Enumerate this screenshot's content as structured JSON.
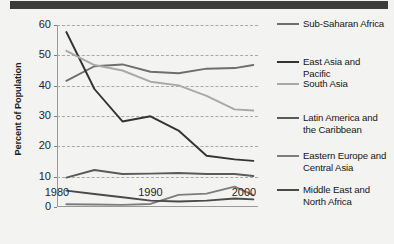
{
  "top_band": {
    "color": "#3b3b3b"
  },
  "axes": {
    "ylabel": "Percent of Population",
    "yticks": [
      "60",
      "50",
      "40",
      "30",
      "20",
      "10",
      "0"
    ],
    "xticks": [
      "1980",
      "1990",
      "2000"
    ]
  },
  "legend": {
    "items": [
      {
        "label": "Sub-Saharan Africa",
        "color": "#6e6e6e"
      },
      {
        "label": "East Asia and\nPacific",
        "color": "#333333"
      },
      {
        "label": "South Asia",
        "color": "#a8a8a8"
      },
      {
        "label": "Latin America and\nthe Caribbean",
        "color": "#5a5a5a"
      },
      {
        "label": "Eastern Europe and\nCentral Asia",
        "color": "#7d7d7d"
      },
      {
        "label": "Middle East and\nNorth Africa",
        "color": "#4a4a4a"
      }
    ]
  },
  "chart_data": {
    "type": "line",
    "title": "",
    "xlabel": "",
    "ylabel": "Percent of Population",
    "xlim": [
      1980.0,
      2001.5
    ],
    "ylim": [
      0,
      60
    ],
    "yticks": [
      0,
      10,
      20,
      30,
      40,
      50,
      60
    ],
    "xticks": [
      1980,
      1990,
      2000
    ],
    "grid": true,
    "grid_style": "dashed horizontal",
    "legend_position": "right",
    "x": [
      1981,
      1984,
      1987,
      1990,
      1993,
      1996,
      1999,
      2001
    ],
    "series": [
      {
        "name": "Sub-Saharan Africa",
        "color": "#6e6e6e",
        "values": [
          41.6,
          46.4,
          47.0,
          44.6,
          44.1,
          45.6,
          45.8,
          46.8
        ]
      },
      {
        "name": "East Asia and Pacific",
        "color": "#333333",
        "values": [
          57.7,
          38.9,
          28.2,
          29.9,
          25.2,
          16.9,
          15.7,
          15.2
        ]
      },
      {
        "name": "South Asia",
        "color": "#a8a8a8",
        "values": [
          51.5,
          46.8,
          45.0,
          41.3,
          40.1,
          36.6,
          32.2,
          31.8
        ]
      },
      {
        "name": "Latin America and the Caribbean",
        "color": "#5a5a5a",
        "values": [
          9.7,
          12.2,
          10.9,
          11.0,
          11.2,
          10.9,
          10.9,
          10.2
        ]
      },
      {
        "name": "Eastern Europe and Central Asia",
        "color": "#7d7d7d",
        "values": [
          0.9,
          0.8,
          0.7,
          1.0,
          4.0,
          4.4,
          6.7,
          3.9
        ]
      },
      {
        "name": "Middle East and North Africa",
        "color": "#4a4a4a",
        "values": [
          5.4,
          4.3,
          3.2,
          2.1,
          1.8,
          2.1,
          2.8,
          2.5
        ]
      }
    ]
  }
}
